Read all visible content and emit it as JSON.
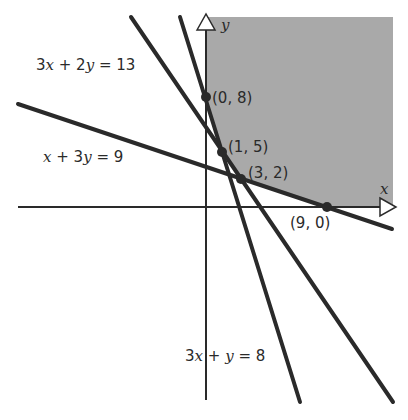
{
  "figure": {
    "type": "linear programming feasible region",
    "shade_color": "#a9a9a9",
    "line_color": "#2a2a2a",
    "axes": {
      "x_label": "x",
      "y_label": "y"
    },
    "lines": [
      {
        "equation": "3x + 2y = 13",
        "label_parts": [
          "3",
          "x",
          " + 2",
          "y",
          " = 13"
        ]
      },
      {
        "equation": "x + 3y = 9",
        "label_parts": [
          "",
          "x",
          " + 3",
          "y",
          " = 9"
        ]
      },
      {
        "equation": "3x + y = 8",
        "label_parts": [
          "3",
          "x",
          " + ",
          "y",
          " = 8"
        ]
      }
    ],
    "vertices": [
      {
        "label": "(0, 8)"
      },
      {
        "label": "(1, 5)"
      },
      {
        "label": "(3, 2)"
      },
      {
        "label": "(9, 0)"
      }
    ]
  }
}
